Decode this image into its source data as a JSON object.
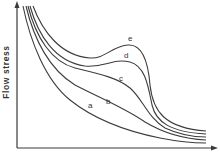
{
  "chart_data": {
    "type": "line",
    "title": "",
    "xlabel": "",
    "ylabel": "Flow stress",
    "grid": false,
    "ticks": false,
    "legend": "inline curve labels",
    "axis_color": "#3a3a3a",
    "line_color": "#3c3c3c",
    "series": [
      {
        "name": "a",
        "label_pos": [
          88,
          108
        ],
        "path": "M23,6 C30,40 45,80 70,100 C95,120 130,132 160,138 C180,142 195,143 206,143"
      },
      {
        "name": "b",
        "label_pos": [
          106,
          104
        ],
        "path": "M26,6 C34,40 50,70 75,85 C100,98 125,108 145,122 C165,134 185,139 206,140"
      },
      {
        "name": "c",
        "label_pos": [
          119,
          81
        ],
        "path": "M28,6 C36,38 52,62 75,68 C100,74 118,78 130,88 C142,98 148,118 165,128 C180,135 195,137 206,137"
      },
      {
        "name": "d",
        "label_pos": [
          124,
          58
        ],
        "path": "M30,6 C38,35 55,62 85,66 C105,68 112,58 130,62 C145,66 148,85 152,105 C156,122 170,132 206,134"
      },
      {
        "name": "e",
        "label_pos": [
          128,
          41
        ],
        "path": "M33,6 C42,30 60,56 90,58 C105,59 112,46 128,45 C142,44 148,60 150,85 C153,112 165,128 206,131"
      }
    ],
    "axes": {
      "y_axis": {
        "x": 17,
        "y_top": 3,
        "y_bottom": 148
      },
      "x_axis": {
        "y": 148,
        "x_left": 17,
        "x_right": 216
      }
    }
  }
}
